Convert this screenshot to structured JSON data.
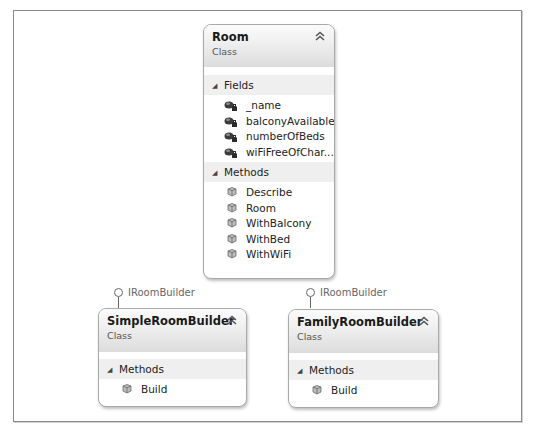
{
  "diagram": {
    "classes": [
      {
        "name": "Room",
        "kind": "Class",
        "sections": [
          {
            "title": "Fields",
            "items": [
              {
                "label": "_name",
                "icon": "private-field-icon"
              },
              {
                "label": "balconyAvailable",
                "icon": "private-field-icon"
              },
              {
                "label": "numberOfBeds",
                "icon": "private-field-icon"
              },
              {
                "label": "wiFiFreeOfChar...",
                "icon": "private-field-icon"
              }
            ]
          },
          {
            "title": "Methods",
            "items": [
              {
                "label": "Describe",
                "icon": "method-icon"
              },
              {
                "label": "Room",
                "icon": "method-icon"
              },
              {
                "label": "WithBalcony",
                "icon": "method-icon"
              },
              {
                "label": "WithBed",
                "icon": "method-icon"
              },
              {
                "label": "WithWiFi",
                "icon": "method-icon"
              }
            ]
          }
        ]
      },
      {
        "name": "SimpleRoomBuilder",
        "kind": "Class",
        "interface": "IRoomBuilder",
        "sections": [
          {
            "title": "Methods",
            "items": [
              {
                "label": "Build",
                "icon": "method-icon"
              }
            ]
          }
        ]
      },
      {
        "name": "FamilyRoomBuilder",
        "kind": "Class",
        "interface": "IRoomBuilder",
        "sections": [
          {
            "title": "Methods",
            "items": [
              {
                "label": "Build",
                "icon": "method-icon"
              }
            ]
          }
        ]
      }
    ],
    "collapse_glyph": "˄",
    "section_glyph": "◢"
  }
}
